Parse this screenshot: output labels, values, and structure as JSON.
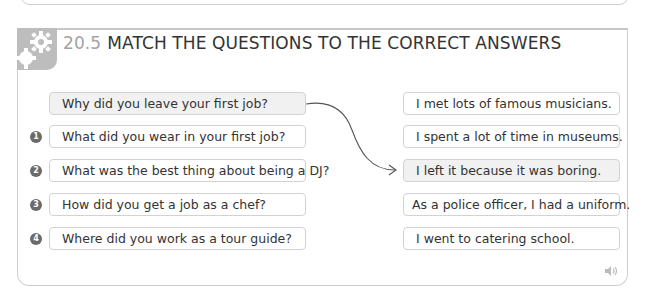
{
  "exercise": {
    "number": "20.5",
    "title": "MATCH THE QUESTIONS TO THE CORRECT ANSWERS",
    "icon": "gears-icon"
  },
  "example": {
    "question": "Why did you leave your first job?",
    "answer": "I left it because it was boring."
  },
  "questions": [
    {
      "badge": "1",
      "text": "What did you wear in your first job?"
    },
    {
      "badge": "2",
      "text": "What was the best thing about being a DJ?"
    },
    {
      "badge": "3",
      "text": "How did you get a job as a chef?"
    },
    {
      "badge": "4",
      "text": "Where did you work as a tour guide?"
    }
  ],
  "answers": [
    "I met lots of famous musicians.",
    "I spent a lot of time in museums.",
    "I left it because it was boring.",
    "As a police officer, I had a uniform.",
    "I went to catering school."
  ],
  "audio_icon": "speaker-icon",
  "colors": {
    "icon_block": "#bdbdbd",
    "number": "#a3a3a3",
    "badge": "#6b6b6b",
    "box_border": "#d2d2d2",
    "example_fill": "#f1f1f1"
  }
}
